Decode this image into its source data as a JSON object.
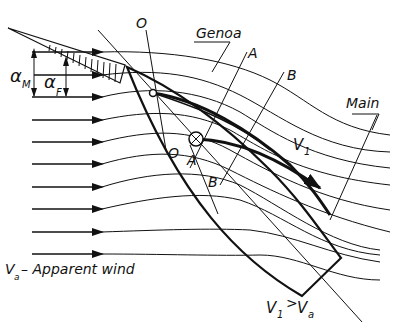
{
  "diagram": {
    "labels": {
      "alpha_m": "α",
      "alpha_m_sub": "M",
      "alpha_f": "α",
      "alpha_f_sub": "F",
      "o_top": "O",
      "o_bottom": "O",
      "genoa": "Genoa",
      "a_top": "A",
      "a_bottom": "A",
      "b_top": "B",
      "b_bottom": "B",
      "main": "Main",
      "v1": "V",
      "v1_sub": "1",
      "apparent_v": "V",
      "apparent_sub": "a",
      "apparent_text": "– Apparent wind",
      "compare_v1": "V",
      "compare_v1_sub": "1",
      "compare_op": ">",
      "compare_va": "V",
      "compare_va_sub": "a"
    },
    "colors": {
      "ink": "#111111",
      "background": "#ffffff"
    }
  }
}
